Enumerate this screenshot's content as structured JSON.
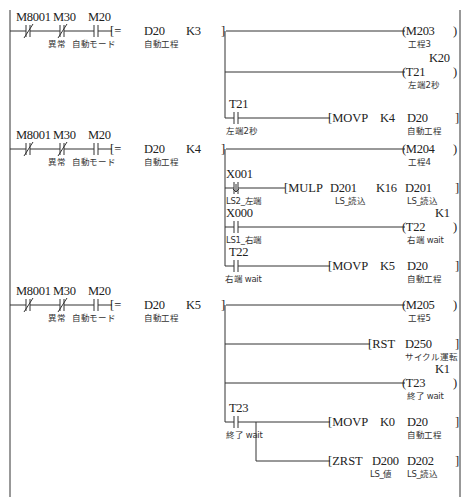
{
  "diagram": {
    "type": "ladder",
    "rungs": [
      {
        "id": "rung1",
        "conditions": [
          {
            "device": "M8001",
            "type": "NC",
            "comment": ""
          },
          {
            "device": "M30",
            "type": "NC",
            "comment": "異常"
          },
          {
            "device": "M20",
            "type": "NO",
            "comment": "自動モード"
          }
        ],
        "compare": {
          "op": "=",
          "s1": "D20",
          "s1_comment": "自動工程",
          "s2": "K3"
        },
        "outputs": [
          {
            "kind": "coil",
            "device": "M203",
            "comment": "工程3"
          },
          {
            "kind": "coil",
            "device": "T21",
            "setting": "K20",
            "comment": "左端2秒"
          },
          {
            "kind": "instruction",
            "contact": "T21",
            "contact_comment": "左端2秒",
            "instr": "MOVP",
            "arg1": "K4",
            "arg2": "D20",
            "arg2_comment": "自動工程"
          }
        ]
      },
      {
        "id": "rung2",
        "conditions": [
          {
            "device": "M8001",
            "type": "NC",
            "comment": ""
          },
          {
            "device": "M30",
            "type": "NC",
            "comment": "異常"
          },
          {
            "device": "M20",
            "type": "NO",
            "comment": "自動モード"
          }
        ],
        "compare": {
          "op": "=",
          "s1": "D20",
          "s1_comment": "自動工程",
          "s2": "K4"
        },
        "outputs": [
          {
            "kind": "coil",
            "device": "M204",
            "comment": "工程4"
          },
          {
            "kind": "instruction",
            "contact": "X001",
            "contact_type": "rising",
            "contact_comment": "LS2_左端",
            "instr": "MULP",
            "arg1": "D201",
            "arg1_comment": "LS_読込",
            "arg2": "K16",
            "arg3": "D201",
            "arg3_comment": "LS_読込"
          },
          {
            "kind": "coil",
            "contact": "X000",
            "contact_comment": "LS1_右端",
            "device": "T22",
            "setting": "K1",
            "comment": "右端wait"
          },
          {
            "kind": "instruction",
            "contact": "T22",
            "contact_comment": "右端wait",
            "instr": "MOVP",
            "arg1": "K5",
            "arg2": "D20",
            "arg2_comment": "自動工程"
          }
        ]
      },
      {
        "id": "rung3",
        "conditions": [
          {
            "device": "M8001",
            "type": "NC",
            "comment": ""
          },
          {
            "device": "M30",
            "type": "NC",
            "comment": "異常"
          },
          {
            "device": "M20",
            "type": "NO",
            "comment": "自動モード"
          }
        ],
        "compare": {
          "op": "=",
          "s1": "D20",
          "s1_comment": "自動工程",
          "s2": "K5"
        },
        "outputs": [
          {
            "kind": "coil",
            "device": "M205",
            "comment": "工程5"
          },
          {
            "kind": "instruction",
            "instr": "RST",
            "arg1": "D250",
            "arg1_comment": "サイクル運転"
          },
          {
            "kind": "coil",
            "device": "T23",
            "setting": "K1",
            "comment": "終了wait"
          },
          {
            "kind": "instruction",
            "contact": "T23",
            "contact_comment": "終了wait",
            "instr": "MOVP",
            "arg1": "K0",
            "arg2": "D20",
            "arg2_comment": "自動工程"
          },
          {
            "kind": "instruction",
            "instr": "ZRST",
            "arg1": "D200",
            "arg1_comment": "LS_値",
            "arg2": "D202",
            "arg2_comment": "LS_読込"
          }
        ]
      }
    ]
  },
  "labels": {
    "r1": {
      "m8001": "M8001",
      "m30": "M30",
      "m20": "M20",
      "m30c": "異常",
      "m20c": "自動モード",
      "op": "[=",
      "d20": "D20",
      "d20c": "自動工程",
      "k": "K3",
      "close": "]",
      "o1": "(M203",
      "o1c": "工程3",
      "o2set": "K20",
      "o2": "(T21",
      "o2c": "左端2秒",
      "c3": "T21",
      "c3c": "左端2秒",
      "i3": "[MOVP",
      "i3a": "K4",
      "i3b": "D20",
      "i3bc": "自動工程"
    },
    "r2": {
      "m8001": "M8001",
      "m30": "M30",
      "m20": "M20",
      "m30c": "異常",
      "m20c": "自動モード",
      "op": "[=",
      "d20": "D20",
      "d20c": "自動工程",
      "k": "K4",
      "close": "]",
      "o1": "(M204",
      "o1c": "工程4",
      "c2": "X001",
      "c2c": "LS2_左端",
      "i2": "[MULP",
      "i2a": "D201",
      "i2ac": "LS_読込",
      "i2b": "K16",
      "i2c": "D201",
      "i2cc": "LS_読込",
      "c3": "X000",
      "c3c": "LS1_右端",
      "o3set": "K1",
      "o3": "(T22",
      "o3c": "右端 wait",
      "c4": "T22",
      "c4c": "右端 wait",
      "i4": "[MOVP",
      "i4a": "K5",
      "i4b": "D20",
      "i4bc": "自動工程"
    },
    "r3": {
      "m8001": "M8001",
      "m30": "M30",
      "m20": "M20",
      "m30c": "異常",
      "m20c": "自動モード",
      "op": "[=",
      "d20": "D20",
      "d20c": "自動工程",
      "k": "K5",
      "close": "]",
      "o1": "(M205",
      "o1c": "工程5",
      "i2": "[RST",
      "i2a": "D250",
      "i2ac": "サイクル運転",
      "o3set": "K1",
      "o3": "(T23",
      "o3c": "終了 wait",
      "c4": "T23",
      "c4c": "終了 wait",
      "i4": "[MOVP",
      "i4a": "K0",
      "i4b": "D20",
      "i4bc": "自動工程",
      "i5": "[ZRST",
      "i5a": "D200",
      "i5ac": "LS_値",
      "i5b": "D202",
      "i5bc": "LS_読込"
    }
  }
}
